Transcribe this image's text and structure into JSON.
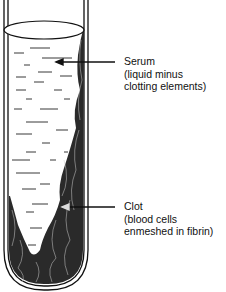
{
  "diagram": {
    "labels": [
      {
        "id": "serum",
        "title": "Serum",
        "line1": "(liquid minus",
        "line2": "clotting elements)"
      },
      {
        "id": "clot",
        "title": "Clot",
        "line1": "(blood cells",
        "line2": "enmeshed in fibrin)"
      }
    ],
    "colors": {
      "ink": "#111111",
      "paper": "#ffffff",
      "clot": "#2a2a2a"
    }
  }
}
